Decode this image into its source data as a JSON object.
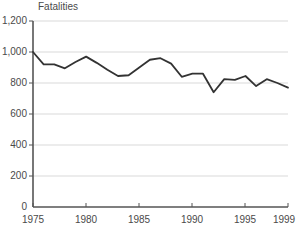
{
  "chart_data": {
    "type": "line",
    "title": "Fatalities",
    "xlabel": "",
    "ylabel": "",
    "xlim": [
      1975,
      1999
    ],
    "ylim": [
      0,
      1200
    ],
    "yticks": [
      0,
      200,
      400,
      600,
      800,
      1000,
      1200
    ],
    "ytick_labels": [
      "0",
      "200",
      "400",
      "600",
      "800",
      "1,000",
      "1,200"
    ],
    "xticks": [
      1975,
      1980,
      1985,
      1990,
      1995,
      1999
    ],
    "xtick_labels": [
      "1975",
      "1980",
      "1985",
      "1990",
      "1995",
      "1999"
    ],
    "grid": true,
    "grid_axis": "y",
    "legend": false,
    "line_color": "#333333",
    "grid_color": "#d9d9d9",
    "axis_color": "#555555",
    "background_color": "#ffffff",
    "x": [
      1975,
      1976,
      1977,
      1978,
      1979,
      1980,
      1981,
      1982,
      1983,
      1984,
      1985,
      1986,
      1987,
      1988,
      1989,
      1990,
      1991,
      1992,
      1993,
      1994,
      1995,
      1996,
      1997,
      1998,
      1999
    ],
    "series": [
      {
        "name": "Fatalities",
        "values": [
          1000,
          920,
          920,
          895,
          935,
          970,
          930,
          885,
          845,
          850,
          900,
          950,
          960,
          925,
          840,
          860,
          860,
          740,
          825,
          820,
          845,
          780,
          825,
          800,
          770
        ]
      }
    ]
  },
  "figure": {
    "title_text": "Fatalities"
  }
}
